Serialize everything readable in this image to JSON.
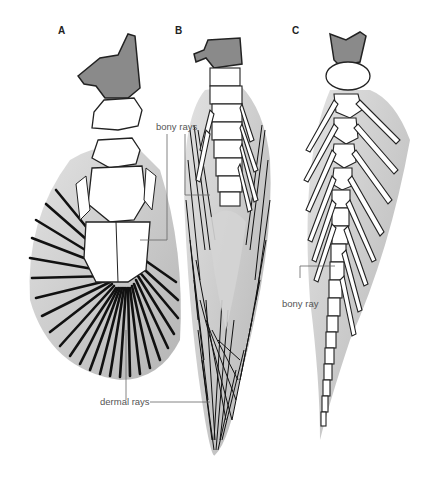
{
  "panels": [
    {
      "letter": "A",
      "structure": "fan-shaped fin"
    },
    {
      "letter": "B",
      "structure": "lobed fin"
    },
    {
      "letter": "C",
      "structure": "archipterygium fin"
    }
  ],
  "labels": {
    "bony_rays": "bony rays",
    "bony_ray": "bony ray",
    "dermal_rays": "dermal rays"
  },
  "colors": {
    "fin_fill": "#c8c8c8",
    "girdle_fill": "#8a8a8a",
    "bone_fill": "#ffffff",
    "ray_stroke": "#111111",
    "leader_line": "#666666"
  }
}
